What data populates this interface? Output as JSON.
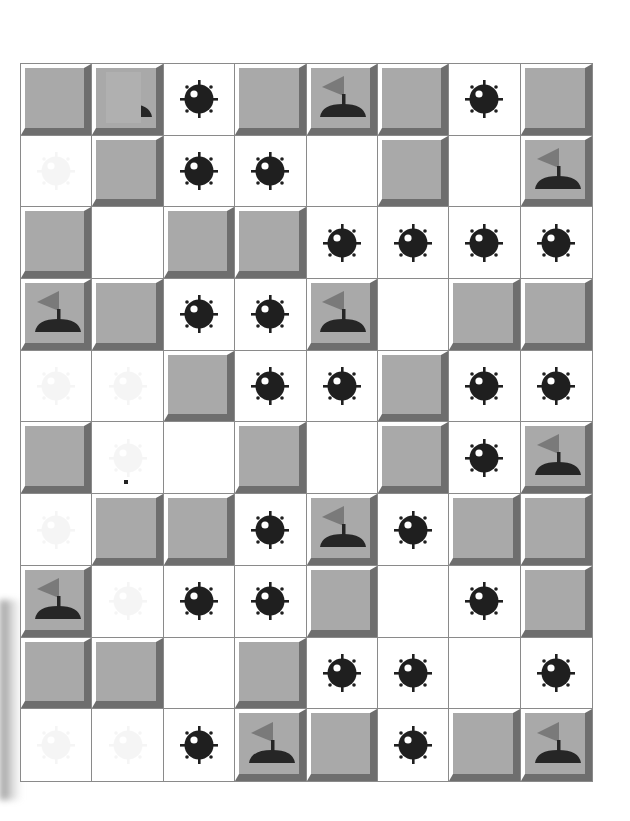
{
  "game": {
    "name": "minesweeper-board",
    "rows": 10,
    "columns": 8,
    "colors": {
      "tile_face": "#a9a9a9",
      "tile_highlight": "#ffffff",
      "tile_shadow": "#6e6e6e",
      "grid_line": "#8a8a8a",
      "mine": "#1f1f1f",
      "flag": "#7a7a7a",
      "flag_base": "#262626",
      "revealed": "#ffffff"
    },
    "legend": {
      "hidden": "covered tile",
      "mine": "revealed mine",
      "flag": "flagged tile",
      "flag_covered": "flagged tile partially covered",
      "empty": "revealed empty",
      "ghost": "revealed empty with faint mine ghost",
      "ghost_dot": "revealed empty with faint mine ghost and dot"
    },
    "board": [
      [
        "hidden",
        "flag_covered",
        "mine",
        "hidden",
        "flag",
        "hidden",
        "mine",
        "hidden"
      ],
      [
        "ghost",
        "hidden",
        "mine",
        "mine",
        "empty",
        "hidden",
        "empty",
        "flag"
      ],
      [
        "hidden",
        "empty",
        "hidden",
        "hidden",
        "mine",
        "mine",
        "mine",
        "mine"
      ],
      [
        "flag",
        "hidden",
        "mine",
        "mine",
        "flag",
        "empty",
        "hidden",
        "hidden"
      ],
      [
        "ghost",
        "ghost",
        "hidden",
        "mine",
        "mine",
        "hidden",
        "mine",
        "mine"
      ],
      [
        "hidden",
        "ghost_dot",
        "empty",
        "hidden",
        "empty",
        "hidden",
        "mine",
        "flag"
      ],
      [
        "ghost",
        "hidden",
        "hidden",
        "mine",
        "flag",
        "mine",
        "hidden",
        "hidden"
      ],
      [
        "flag",
        "ghost",
        "mine",
        "mine",
        "hidden",
        "empty",
        "mine",
        "hidden"
      ],
      [
        "hidden",
        "hidden",
        "empty",
        "hidden",
        "mine",
        "mine",
        "empty",
        "mine"
      ],
      [
        "ghost",
        "ghost",
        "mine",
        "flag",
        "hidden",
        "mine",
        "hidden",
        "flag"
      ]
    ]
  }
}
